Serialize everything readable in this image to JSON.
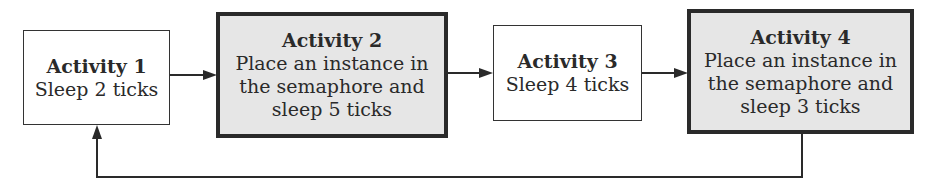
{
  "diagram": {
    "type": "flowchart",
    "nodes": [
      {
        "id": "activity-1",
        "title": "Activity 1",
        "lines": [
          "Sleep 2 ticks"
        ],
        "style": "plain"
      },
      {
        "id": "activity-2",
        "title": "Activity 2",
        "lines": [
          "Place an instance in",
          "the semaphore and",
          "sleep 5 ticks"
        ],
        "style": "shaded"
      },
      {
        "id": "activity-3",
        "title": "Activity 3",
        "lines": [
          "Sleep 4 ticks"
        ],
        "style": "plain"
      },
      {
        "id": "activity-4",
        "title": "Activity 4",
        "lines": [
          "Place an instance in",
          "the semaphore and",
          "sleep 3 ticks"
        ],
        "style": "shaded"
      }
    ],
    "edges": [
      {
        "from": "activity-1",
        "to": "activity-2"
      },
      {
        "from": "activity-2",
        "to": "activity-3"
      },
      {
        "from": "activity-3",
        "to": "activity-4"
      },
      {
        "from": "activity-4",
        "to": "activity-1",
        "route": "loop-back-below"
      }
    ],
    "colors": {
      "shaded_fill": "#e6e6e6",
      "stroke": "#2a2a2a",
      "background": "#ffffff"
    }
  }
}
